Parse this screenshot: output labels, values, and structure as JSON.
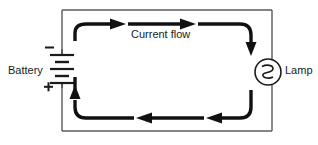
{
  "diagram": {
    "type": "circuit-schematic",
    "labels": {
      "battery": "Battery",
      "lamp": "Lamp",
      "current_flow": "Current flow"
    },
    "battery": {
      "terminal_negative": "−",
      "terminal_positive": "+",
      "negative_position": "top",
      "positive_position": "bottom",
      "cell_count": 2,
      "symbol_name": "battery-symbol"
    },
    "lamp": {
      "symbol_name": "lamp-symbol",
      "shape": "circle-with-filament",
      "center_x": 268,
      "center_y": 72,
      "radius": 13
    },
    "current": {
      "direction": "clockwise",
      "arrow_count": 5,
      "description": "Current flows from battery, clockwise around the loop, through the lamp and back"
    },
    "colors": {
      "wire": "#5a5a5a",
      "flow_arrow": "#111111",
      "component": "#1a1a1a",
      "background": "#ffffff"
    },
    "geometry": {
      "loop_left_x": 62,
      "loop_right_x": 272,
      "loop_top_y": 10,
      "loop_bottom_y": 131
    }
  }
}
